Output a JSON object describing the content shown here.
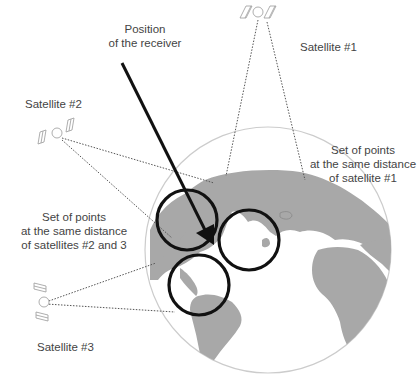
{
  "diagram": {
    "labels": {
      "receiver": [
        "Position",
        "of the receiver"
      ],
      "satellite1": "Satellite #1",
      "satellite2": "Satellite #2",
      "satellite3": "Satellite #3",
      "sphere1": [
        "Set of points",
        "at the same distance",
        "of satellite #1"
      ],
      "sphere23": [
        "Set of points",
        "at the same distance",
        "of satellites #2 and 3"
      ]
    },
    "colors": {
      "land": "#a8a8a8",
      "ocean": "#ffffff",
      "globe_outline": "#cccccc",
      "circles": "#111111",
      "arrow": "#111111",
      "dotted_lines": "#555555",
      "text": "#444444",
      "satellite": "#999999"
    }
  }
}
